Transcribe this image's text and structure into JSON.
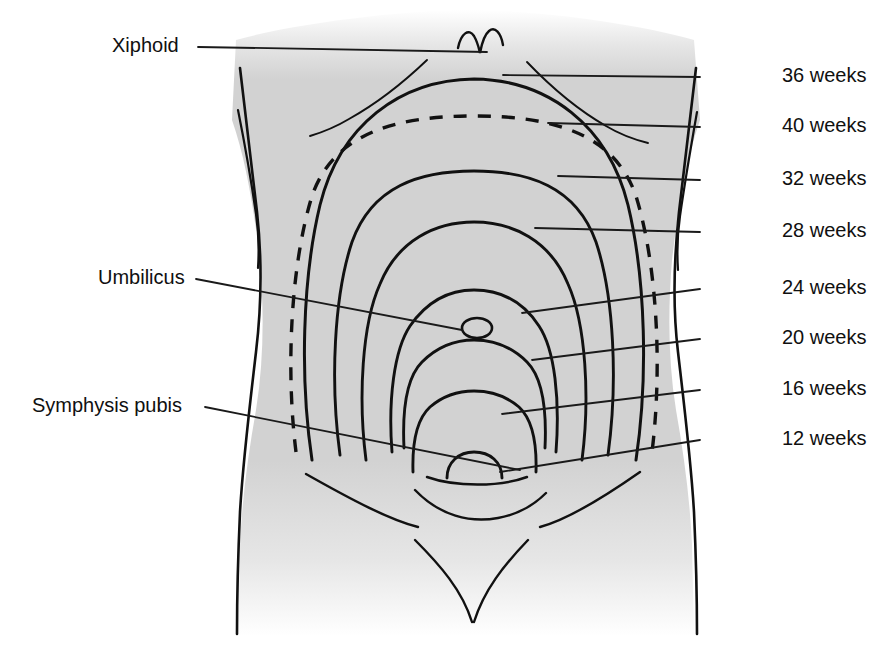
{
  "figure": {
    "colors": {
      "ink": "#111111",
      "body_fill": "#d2d2d2",
      "background": "#ffffff",
      "leader_line": "#1a1a1a"
    }
  },
  "landmark_labels": [
    {
      "id": "xiphoid",
      "text": "Xiphoid",
      "side": "left",
      "x": 112,
      "y": 34,
      "leader": {
        "x1": 198,
        "y1": 47,
        "x2": 487,
        "y2": 52
      }
    },
    {
      "id": "umbilicus",
      "text": "Umbilicus",
      "side": "left",
      "x": 98,
      "y": 266,
      "leader": {
        "x1": 196,
        "y1": 279,
        "x2": 462,
        "y2": 330
      }
    },
    {
      "id": "symphysis-pubis",
      "text": "Symphysis pubis",
      "side": "left",
      "x": 32,
      "y": 394,
      "leader": {
        "x1": 205,
        "y1": 407,
        "x2": 520,
        "y2": 470
      }
    }
  ],
  "week_labels": [
    {
      "id": "w36",
      "weeks": 36,
      "text": "36 weeks",
      "x": 782,
      "y": 64,
      "leader": {
        "x1": 700,
        "y1": 77,
        "x2": 503,
        "y2": 75
      },
      "dashed": false
    },
    {
      "id": "w40",
      "weeks": 40,
      "text": "40 weeks",
      "x": 782,
      "y": 114,
      "leader": {
        "x1": 700,
        "y1": 127,
        "x2": 548,
        "y2": 123
      },
      "dashed": true
    },
    {
      "id": "w32",
      "weeks": 32,
      "text": "32 weeks",
      "x": 782,
      "y": 167,
      "leader": {
        "x1": 700,
        "y1": 180,
        "x2": 558,
        "y2": 176
      },
      "dashed": false
    },
    {
      "id": "w28",
      "weeks": 28,
      "text": "28 weeks",
      "x": 782,
      "y": 219,
      "leader": {
        "x1": 700,
        "y1": 232,
        "x2": 535,
        "y2": 228
      },
      "dashed": false
    },
    {
      "id": "w24",
      "weeks": 24,
      "text": "24 weeks",
      "x": 782,
      "y": 276,
      "leader": {
        "x1": 700,
        "y1": 289,
        "x2": 522,
        "y2": 313
      },
      "dashed": false
    },
    {
      "id": "w20",
      "weeks": 20,
      "text": "20 weeks",
      "x": 782,
      "y": 326,
      "leader": {
        "x1": 700,
        "y1": 339,
        "x2": 532,
        "y2": 360
      },
      "dashed": false
    },
    {
      "id": "w16",
      "weeks": 16,
      "text": "16 weeks",
      "x": 782,
      "y": 377,
      "leader": {
        "x1": 700,
        "y1": 390,
        "x2": 502,
        "y2": 414
      },
      "dashed": false
    },
    {
      "id": "w12",
      "weeks": 12,
      "text": "12 weeks",
      "x": 782,
      "y": 427,
      "leader": {
        "x1": 700,
        "y1": 440,
        "x2": 500,
        "y2": 472
      },
      "dashed": false
    }
  ],
  "fundal_curves": [
    {
      "id": "curve-40",
      "weeks": 40,
      "dashed": true,
      "apex_y": 120,
      "note": "dashed ellipse-like outline, highest-widest"
    },
    {
      "id": "curve-36",
      "weeks": 36,
      "dashed": false,
      "apex_y": 80,
      "note": "solid, above 40-week line"
    },
    {
      "id": "curve-32",
      "weeks": 32,
      "dashed": false,
      "apex_y": 172
    },
    {
      "id": "curve-28",
      "weeks": 28,
      "dashed": false,
      "apex_y": 222
    },
    {
      "id": "curve-24",
      "weeks": 24,
      "dashed": false,
      "apex_y": 305
    },
    {
      "id": "curve-20",
      "weeks": 20,
      "dashed": false,
      "apex_y": 355
    },
    {
      "id": "curve-16",
      "weeks": 16,
      "dashed": false,
      "apex_y": 408
    },
    {
      "id": "curve-12",
      "weeks": 12,
      "dashed": false,
      "apex_y": 462,
      "note": "small mound at symphysis pubis"
    }
  ]
}
